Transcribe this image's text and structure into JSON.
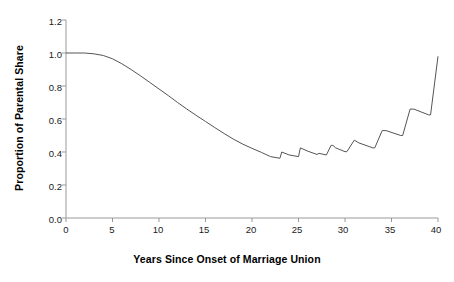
{
  "chart_data": {
    "type": "line",
    "title": "",
    "xlabel": "Years Since Onset of Marriage Union",
    "ylabel": "Proportion of Parental Share",
    "xlim": [
      0,
      40
    ],
    "ylim": [
      0.0,
      1.2
    ],
    "xticks": [
      "0",
      "5",
      "10",
      "15",
      "20",
      "25",
      "30",
      "35",
      "40"
    ],
    "xtick_values": [
      0,
      5,
      10,
      15,
      20,
      25,
      30,
      35,
      40
    ],
    "yticks": [
      "0.0",
      "0.2",
      "0.4",
      "0.6",
      "0.8",
      "1.0",
      "1.2"
    ],
    "ytick_values": [
      0.0,
      0.2,
      0.4,
      0.6,
      0.8,
      1.0,
      1.2
    ],
    "grid": false,
    "legend": false,
    "line_color": "#555555",
    "axis_color": "#999999",
    "series": [
      {
        "name": "Proportion of Parental Share",
        "x": [
          0,
          1,
          2,
          3,
          4,
          5,
          6,
          7,
          8,
          9,
          10,
          11,
          12,
          13,
          14,
          15,
          16,
          17,
          18,
          19,
          20,
          21,
          22,
          23,
          23.2,
          24,
          25,
          25.2,
          26,
          27,
          27.2,
          28,
          28.5,
          28.7,
          29,
          30,
          30.2,
          31,
          31.5,
          33,
          33.2,
          34,
          34.4,
          36,
          36.2,
          37,
          37.4,
          39,
          39.2,
          40
        ],
        "values": [
          1.0,
          1.0,
          1.0,
          0.995,
          0.985,
          0.965,
          0.935,
          0.9,
          0.862,
          0.822,
          0.782,
          0.742,
          0.7,
          0.66,
          0.622,
          0.585,
          0.548,
          0.512,
          0.478,
          0.448,
          0.422,
          0.398,
          0.372,
          0.362,
          0.4,
          0.382,
          0.372,
          0.425,
          0.405,
          0.385,
          0.392,
          0.382,
          0.44,
          0.44,
          0.425,
          0.402,
          0.402,
          0.472,
          0.455,
          0.425,
          0.425,
          0.53,
          0.53,
          0.5,
          0.5,
          0.66,
          0.66,
          0.625,
          0.625,
          0.98
        ]
      }
    ],
    "annotations": [
      {
        "text": "curve flat at 1.0 through year ~2, then smooth monotonic decline"
      },
      {
        "text": "minimum of ~0.36 at year 22"
      },
      {
        "text": "sawtooth oscillation between years 22 and 39"
      },
      {
        "text": "sharp rise to ~0.98 at year 40"
      }
    ]
  }
}
